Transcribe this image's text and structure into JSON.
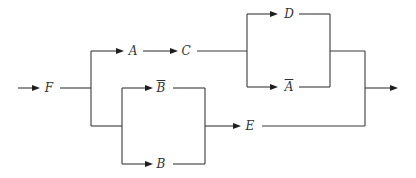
{
  "diagram": {
    "type": "reliability-block-diagram",
    "input_label": "input",
    "output_label": "output",
    "blocks": [
      {
        "id": "F",
        "label": "F",
        "complement": false
      },
      {
        "id": "A",
        "label": "A",
        "complement": false
      },
      {
        "id": "C",
        "label": "C",
        "complement": false
      },
      {
        "id": "D",
        "label": "D",
        "complement": false
      },
      {
        "id": "A_bar",
        "label": "A",
        "complement": true
      },
      {
        "id": "B_bar",
        "label": "B",
        "complement": true
      },
      {
        "id": "B",
        "label": "B",
        "complement": false
      },
      {
        "id": "E",
        "label": "E",
        "complement": false
      }
    ],
    "structure": "F → ( (A → C → (D ∥ Ā)) ∥ ((B̄ ∥ B) → E) ) → output",
    "colors": {
      "line": "#3a3a3a",
      "arrowhead": "#1e1e1e",
      "text": "#333333",
      "background": "#ffffff"
    }
  }
}
